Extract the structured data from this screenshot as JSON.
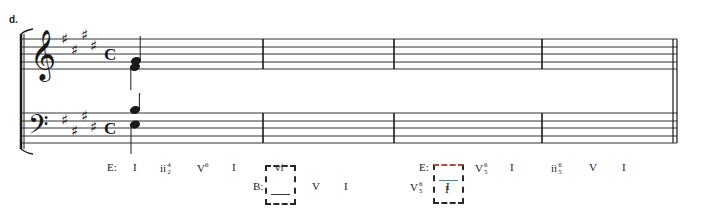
{
  "example_label": "d.",
  "key_signature": {
    "name": "E major",
    "sharps": [
      "F#",
      "C#",
      "G#",
      "D#"
    ]
  },
  "time_signature": "C",
  "staves": {
    "treble": {
      "clef": "treble",
      "line_y": [
        39,
        47,
        54,
        62,
        69
      ]
    },
    "bass": {
      "clef": "bass",
      "line_y": [
        113,
        121,
        128,
        136,
        143
      ]
    }
  },
  "barlines_x": [
    263,
    394,
    542
  ],
  "final_barline_x": [
    673,
    677
  ],
  "staff_x": [
    22,
    677
  ],
  "measure_1_notes": {
    "treble": [
      {
        "pitch": "G#4",
        "stem": "up"
      },
      {
        "pitch": "E4",
        "stem": "down"
      }
    ],
    "bass": [
      {
        "pitch": "B3",
        "stem": "up"
      },
      {
        "pitch": "E3",
        "stem": "down"
      }
    ]
  },
  "analysis": {
    "row1": [
      {
        "id": "key1",
        "text": "E:",
        "x": 107,
        "y": 168
      },
      {
        "id": "c1",
        "text": "I",
        "x": 133,
        "y": 168
      },
      {
        "id": "c2",
        "text": "ii",
        "fig_top": "4",
        "fig_bot": "2",
        "x": 160,
        "y": 168
      },
      {
        "id": "c3",
        "text": "V",
        "sup": "6",
        "x": 197,
        "y": 168
      },
      {
        "id": "c4",
        "text": "I",
        "x": 232,
        "y": 168
      },
      {
        "id": "c5",
        "text": "vi",
        "x": 275,
        "y": 168
      },
      {
        "id": "key2",
        "text": "E:",
        "x": 419,
        "y": 168
      },
      {
        "id": "c6",
        "text": "V",
        "fig_top": "6",
        "fig_bot": "5",
        "x": 475,
        "y": 168
      },
      {
        "id": "c7",
        "text": "I",
        "x": 510,
        "y": 168
      },
      {
        "id": "c8",
        "text": "ii",
        "fig_top": "6",
        "fig_bot": "5",
        "x": 551,
        "y": 168
      },
      {
        "id": "c9",
        "text": "V",
        "x": 589,
        "y": 168
      },
      {
        "id": "c10",
        "text": "I",
        "x": 622,
        "y": 168
      }
    ],
    "row2": [
      {
        "id": "key3",
        "text": "B:",
        "x": 253,
        "y": 187
      },
      {
        "id": "c11",
        "text": "V",
        "x": 312,
        "y": 187
      },
      {
        "id": "c12",
        "text": "I",
        "x": 344,
        "y": 187
      },
      {
        "id": "c13",
        "text": "V",
        "fig_top": "6",
        "fig_bot": "5",
        "x": 410,
        "y": 187
      },
      {
        "id": "c14",
        "text": "I",
        "x": 446,
        "y": 187
      }
    ],
    "pivot_boxes": [
      {
        "id": "pivot1",
        "x": 265,
        "y": 165,
        "w": 31,
        "h": 40,
        "top_chord": "vi",
        "bottom_chord": "",
        "bottom_blank": true
      },
      {
        "id": "pivot2",
        "x": 433,
        "y": 164,
        "w": 31,
        "h": 40,
        "top_chord": "",
        "top_blank": true,
        "bottom_chord": "I"
      }
    ]
  },
  "colors": {
    "ink": "#1a1a1a",
    "staff": "#333333",
    "box_dash": "#2a2a2a",
    "box_accent": "#b54a3a"
  }
}
